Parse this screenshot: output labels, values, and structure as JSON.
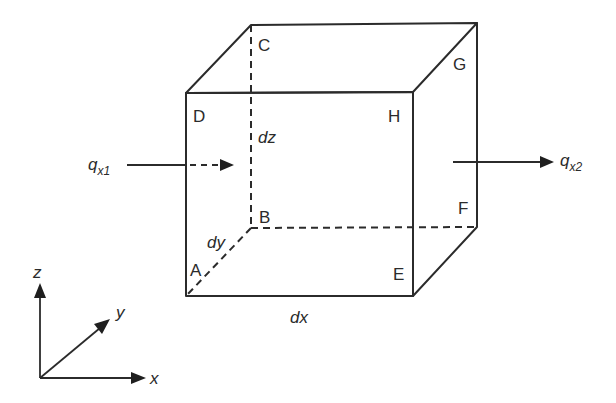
{
  "diagram": {
    "vertices": {
      "A": "A",
      "B": "B",
      "C": "C",
      "D": "D",
      "E": "E",
      "F": "F",
      "G": "G",
      "H": "H"
    },
    "dimensions": {
      "dx": "dx",
      "dy": "dy",
      "dz": "dz"
    },
    "flux_in": {
      "symbol": "q",
      "subscript": "x1"
    },
    "flux_out": {
      "symbol": "q",
      "subscript": "x2"
    },
    "axes": {
      "x": "x",
      "y": "y",
      "z": "z"
    }
  }
}
